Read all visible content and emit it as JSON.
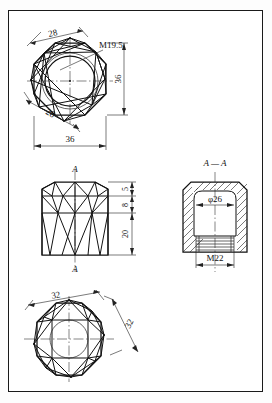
{
  "drawing": {
    "title": "Octagonal Cap Nut - Orthographic Engineering Drawing",
    "sheet_border": true,
    "line_color": "#111111",
    "background_color": "#ffffff"
  },
  "views": {
    "top": {
      "name": "top-view",
      "shape": "octagon",
      "thread_label": "M19.5",
      "dim_across_flats_diagonal": "28",
      "dim_across_flats_diagonal_2": "28",
      "dim_width": "36",
      "dim_height": "36"
    },
    "front": {
      "name": "front-view",
      "section_marker_top": "A",
      "section_marker_bottom": "A",
      "dim_chamfer": "5",
      "dim_mid": "8",
      "dim_body": "20"
    },
    "section": {
      "name": "section-view",
      "label": "A — A",
      "dim_bore": "φ26",
      "dim_thread": "M22"
    },
    "bottom": {
      "name": "bottom-view",
      "shape": "octagon",
      "dim_width": "32",
      "dim_diagonal": "32"
    }
  }
}
